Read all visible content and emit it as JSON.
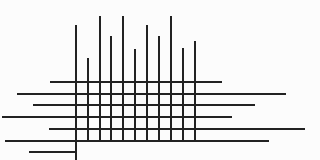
{
  "diagram": {
    "type": "line-grid",
    "background_color": "#fcfcfc",
    "line_color": "#222222",
    "vertical_lines": [
      {
        "x": 76,
        "y_top": 25,
        "y_bottom": 160
      },
      {
        "x": 88,
        "y_top": 58,
        "y_bottom": 141
      },
      {
        "x": 100,
        "y_top": 16,
        "y_bottom": 141
      },
      {
        "x": 111,
        "y_top": 36,
        "y_bottom": 141
      },
      {
        "x": 123,
        "y_top": 16,
        "y_bottom": 141
      },
      {
        "x": 135,
        "y_top": 49,
        "y_bottom": 141
      },
      {
        "x": 147,
        "y_top": 25,
        "y_bottom": 141
      },
      {
        "x": 159,
        "y_top": 36,
        "y_bottom": 141
      },
      {
        "x": 171,
        "y_top": 16,
        "y_bottom": 141
      },
      {
        "x": 183,
        "y_top": 48,
        "y_bottom": 141
      },
      {
        "x": 195,
        "y_top": 41,
        "y_bottom": 141
      }
    ],
    "horizontal_lines": [
      {
        "y": 82,
        "x_left": 50,
        "x_right": 222
      },
      {
        "y": 94,
        "x_left": 17,
        "x_right": 286
      },
      {
        "y": 105,
        "x_left": 33,
        "x_right": 255
      },
      {
        "y": 117,
        "x_left": 2,
        "x_right": 232
      },
      {
        "y": 129,
        "x_left": 49,
        "x_right": 305
      },
      {
        "y": 141,
        "x_left": 5,
        "x_right": 269
      },
      {
        "y": 152,
        "x_left": 29,
        "x_right": 76
      }
    ]
  }
}
